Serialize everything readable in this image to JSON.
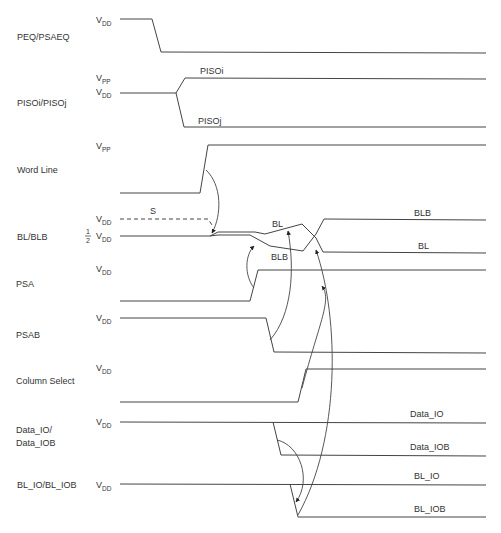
{
  "diagram": {
    "type": "timing-diagram",
    "signals": [
      {
        "name": "PEQ/PSAEQ",
        "levels": [
          "V_DD"
        ]
      },
      {
        "name": "PISOi/PISOj",
        "levels": [
          "V_PP",
          "V_DD"
        ],
        "branches": [
          "PISOi",
          "PISOj"
        ]
      },
      {
        "name": "Word Line",
        "levels": [
          "V_PP"
        ]
      },
      {
        "name": "BL/BLB",
        "levels": [
          "V_DD",
          "1/2 V_DD"
        ],
        "annotations": [
          "S",
          "BL",
          "BLB",
          "BLB",
          "BL"
        ]
      },
      {
        "name": "PSA",
        "levels": [
          "V_DD"
        ]
      },
      {
        "name": "PSAB",
        "levels": [
          "V_DD"
        ]
      },
      {
        "name": "Column Select",
        "levels": [
          "V_DD"
        ]
      },
      {
        "name": "Data_IO/\nData_IOB",
        "levels": [
          "V_DD"
        ],
        "branches": [
          "Data_IO",
          "Data_IOB"
        ]
      },
      {
        "name": "BL_IO/BL_IOB",
        "levels": [
          "V_DD"
        ],
        "branches": [
          "BL_IO",
          "BL_IOB"
        ]
      }
    ]
  },
  "labels": {
    "peq": "PEQ/PSAEQ",
    "piso": "PISOi/PISOj",
    "pisoi": "PISOi",
    "pisoj": "PISOj",
    "wordline": "Word Line",
    "blblb": "BL/BLB",
    "s": "S",
    "bl_mid": "BL",
    "blb_mid": "BLB",
    "blb_right": "BLB",
    "bl_right": "BL",
    "psa": "PSA",
    "psab": "PSAB",
    "colsel": "Column Select",
    "dataio_1": "Data_IO/",
    "dataio_2": "Data_IOB",
    "dataio_right": "Data_IO",
    "dataiob_right": "Data_IOB",
    "blio": "BL_IO/BL_IOB",
    "blio_right": "BL_IO",
    "bliob_right": "BL_IOB",
    "v": "V",
    "dd": "DD",
    "pp": "PP",
    "half_num": "1",
    "half_den": "2"
  }
}
